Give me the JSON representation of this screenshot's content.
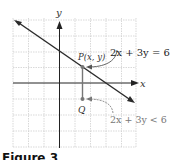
{
  "figure": {
    "caption": "Figure 3",
    "axes": {
      "x_label": "x",
      "y_label": "y"
    },
    "line": {
      "equation": "2x + 3y = 6"
    },
    "inequality": {
      "text": "2x + 3y < 6"
    },
    "point_p": {
      "label": "P(x, y)"
    },
    "point_q": {
      "label": "Q"
    },
    "colors": {
      "grid": "#c8c8c8",
      "axis": "#222222",
      "line": "#2a2a2a",
      "point": "#777777"
    }
  }
}
